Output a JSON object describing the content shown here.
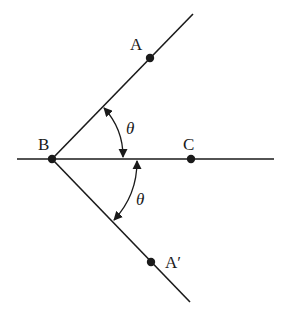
{
  "diagram": {
    "colors": {
      "line": "#1a1a1a",
      "background": "#ffffff"
    },
    "points": {
      "A": {
        "label": "A",
        "x": 150,
        "y": 58
      },
      "B": {
        "label": "B",
        "x": 52,
        "y": 159
      },
      "C": {
        "label": "C",
        "x": 191,
        "y": 159
      },
      "A_prime": {
        "label": "A′",
        "x": 151,
        "y": 262
      }
    },
    "angles": [
      {
        "label": "θ",
        "between": [
          "BA",
          "BC"
        ]
      },
      {
        "label": "θ",
        "between": [
          "BC",
          "BA′"
        ]
      }
    ]
  }
}
